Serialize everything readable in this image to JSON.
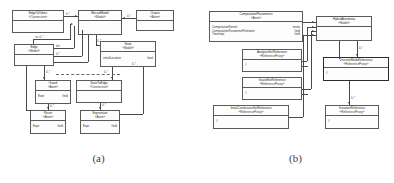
{
  "figure": {
    "panels": [
      {
        "id": "a",
        "caption": "(a)",
        "classes": [
          {
            "key": "edgetotoken",
            "name": "EdgeToToken",
            "stereotype": "«Connection»",
            "attributes": []
          },
          {
            "key": "mocadmodel",
            "name": "MocadModel",
            "stereotype": "«Model»",
            "attributes": []
          },
          {
            "key": "output",
            "name": "Output",
            "stereotype": "«Atom»",
            "attributes": []
          },
          {
            "key": "edge",
            "name": "Edge",
            "stereotype": "«Model»",
            "attributes": []
          },
          {
            "key": "state",
            "name": "State",
            "stereotype": "«Model»",
            "attributes": [
              {
                "name": "initialLocation:",
                "type": "bool"
              }
            ]
          },
          {
            "key": "guard",
            "name": "Guard",
            "stereotype": "«Atom»",
            "attributes": [
              {
                "name": "Expr:",
                "type": "field"
              }
            ]
          },
          {
            "key": "statetoedge",
            "name": "StateToEdge",
            "stereotype": "«Connection»",
            "attributes": []
          },
          {
            "key": "reset",
            "name": "Reset",
            "stereotype": "«Atom»",
            "attributes": [
              {
                "name": "Expr:",
                "type": "field"
              }
            ]
          },
          {
            "key": "expression",
            "name": "Expression",
            "stereotype": "«Atom»",
            "attributes": [
              {
                "name": "Expr:",
                "type": "field"
              }
            ]
          }
        ],
        "multiplicities": [
          {
            "key": "m1",
            "label": "0..*"
          },
          {
            "key": "m2",
            "label": "0..*"
          },
          {
            "key": "m3",
            "label": "src 0..*"
          },
          {
            "key": "m4",
            "label": "0..*"
          },
          {
            "key": "m5",
            "label": "dst"
          },
          {
            "key": "m6",
            "label": "0..*"
          },
          {
            "key": "m7",
            "label": "0..*"
          },
          {
            "key": "m8",
            "label": "0..*"
          },
          {
            "key": "m9",
            "label": "0..*"
          },
          {
            "key": "m10",
            "label": "0..*"
          },
          {
            "key": "m11",
            "label": "0..*"
          },
          {
            "key": "m12",
            "label": "0..*"
          }
        ]
      },
      {
        "id": "b",
        "caption": "(b)",
        "classes": [
          {
            "key": "computationparameters",
            "name": "ComputationParameters",
            "stereotype": "«Atom»",
            "attributes": [
              {
                "name": "ComputationKernel:",
                "type": "enum"
              },
              {
                "name": "ComputationParameterFilename:",
                "type": "field"
              },
              {
                "name": "Timestep:",
                "type": "field"
              }
            ]
          },
          {
            "key": "hybridautomata",
            "name": "HybridAutomata",
            "stereotype": "«Model»",
            "attributes": []
          },
          {
            "key": "analysissetreference",
            "name": "AnalysisSetReference",
            "stereotype": "«ReferenceProxy»",
            "attributes": [
              {
                "name": "#",
                "type": ""
              }
            ]
          },
          {
            "key": "discretemodereference",
            "name": "DiscreteModeReference",
            "stereotype": "«ReferenceProxy»",
            "attributes": [
              {
                "name": "#",
                "type": ""
              }
            ],
            "emphasized": true
          },
          {
            "key": "guardsetreference",
            "name": "GuardSetReference",
            "stereotype": "«ReferenceProxy»",
            "attributes": [
              {
                "name": "#",
                "type": ""
              }
            ]
          },
          {
            "key": "initialcontinuoussetreference",
            "name": "InitialContinuousSetReference",
            "stereotype": "«ReferenceProxy»",
            "attributes": [
              {
                "name": "#",
                "type": ""
              }
            ]
          },
          {
            "key": "invariantreference",
            "name": "InvariantReference",
            "stereotype": "«ReferenceProxy»",
            "attributes": [
              {
                "name": "#",
                "type": ""
              }
            ]
          }
        ],
        "multiplicities": [
          {
            "key": "n1",
            "label": "0..*"
          },
          {
            "key": "n2",
            "label": "0..*"
          },
          {
            "key": "n3",
            "label": "0..*"
          },
          {
            "key": "n4",
            "label": "0..*"
          }
        ]
      }
    ]
  }
}
